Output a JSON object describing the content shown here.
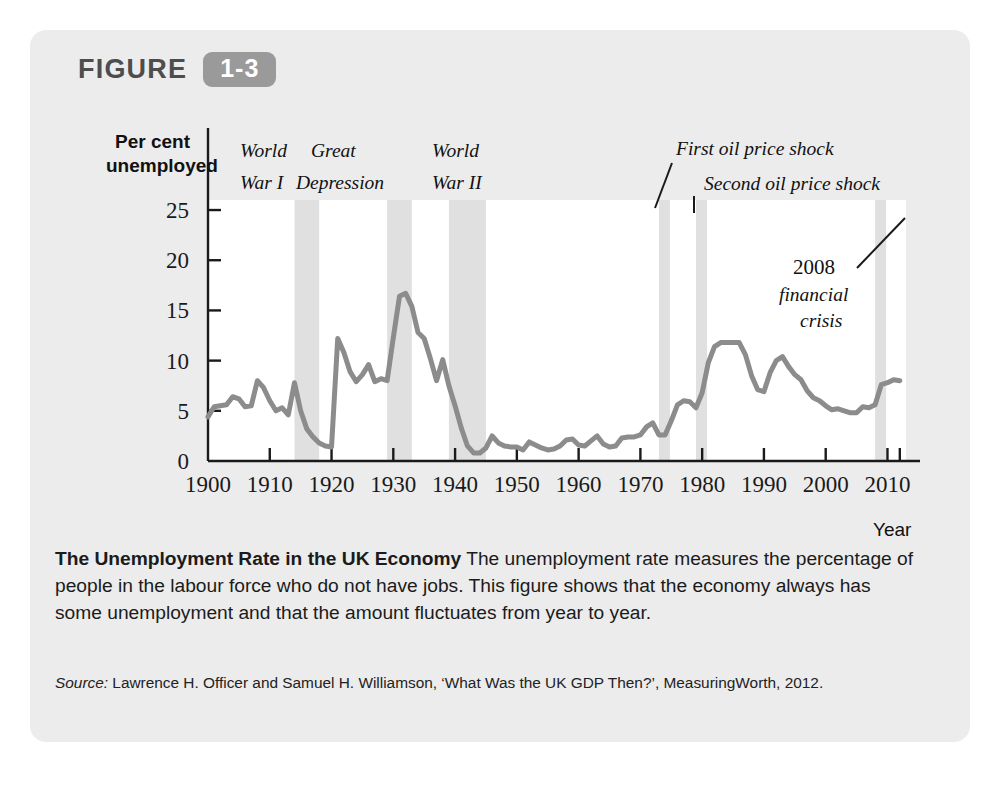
{
  "figure": {
    "label": "FIGURE",
    "number": "1-3",
    "badge_color": "#9a9a9a",
    "panel_color": "#ececec"
  },
  "caption": {
    "title": "The Unemployment Rate in the UK Economy",
    "body": " The unemployment rate measures the percentage of people in the labour force who do not have jobs. This figure shows that the economy always has some unemployment and that the amount fluctuates from year to year."
  },
  "source": {
    "label": "Source:",
    "text": " Lawrence H. Officer and Samuel H. Williamson, ‘What Was the UK GDP Then?’, MeasuringWorth, 2012."
  },
  "chart_data": {
    "type": "line",
    "title": "The Unemployment Rate in the UK Economy",
    "ylabel_line1": "Per cent",
    "ylabel_line2": "unemployed",
    "xlabel": "Year",
    "xlim": [
      1900,
      2013
    ],
    "ylim": [
      0,
      26
    ],
    "yticks": [
      0,
      5,
      10,
      15,
      20,
      25
    ],
    "xticks": [
      1900,
      1910,
      1920,
      1930,
      1940,
      1950,
      1960,
      1970,
      1980,
      1990,
      2000,
      2010
    ],
    "xtick_labels": [
      "1900",
      "1910",
      "1920",
      "1930",
      "1940",
      "1950",
      "1960",
      "1970",
      "1980",
      "1990",
      "2000",
      "2010"
    ],
    "extra_xticks": [
      2012
    ],
    "grid": false,
    "legend": "none",
    "line_color": "#8c8c8c",
    "line_width": 5,
    "series_name": "UK unemployment rate",
    "x": [
      1900,
      1901,
      1902,
      1903,
      1904,
      1905,
      1906,
      1907,
      1908,
      1909,
      1910,
      1911,
      1912,
      1913,
      1914,
      1915,
      1916,
      1917,
      1918,
      1919,
      1920,
      1921,
      1922,
      1923,
      1924,
      1925,
      1926,
      1927,
      1928,
      1929,
      1930,
      1931,
      1932,
      1933,
      1934,
      1935,
      1936,
      1937,
      1938,
      1939,
      1940,
      1941,
      1942,
      1943,
      1944,
      1945,
      1946,
      1947,
      1948,
      1949,
      1950,
      1951,
      1952,
      1953,
      1954,
      1955,
      1956,
      1957,
      1958,
      1959,
      1960,
      1961,
      1962,
      1963,
      1964,
      1965,
      1966,
      1967,
      1968,
      1969,
      1970,
      1971,
      1972,
      1973,
      1974,
      1975,
      1976,
      1977,
      1978,
      1979,
      1980,
      1981,
      1982,
      1983,
      1984,
      1985,
      1986,
      1987,
      1988,
      1989,
      1990,
      1991,
      1992,
      1993,
      1994,
      1995,
      1996,
      1997,
      1998,
      1999,
      2000,
      2001,
      2002,
      2003,
      2004,
      2005,
      2006,
      2007,
      2008,
      2009,
      2010,
      2011,
      2012
    ],
    "y": [
      4.4,
      5.4,
      5.5,
      5.6,
      6.4,
      6.2,
      5.4,
      5.5,
      8.0,
      7.3,
      6.0,
      5.0,
      5.3,
      4.6,
      7.8,
      5.0,
      3.2,
      2.4,
      1.8,
      1.5,
      1.4,
      12.2,
      10.8,
      8.9,
      7.9,
      8.6,
      9.6,
      7.9,
      8.2,
      8.0,
      12.3,
      16.4,
      16.7,
      15.4,
      12.8,
      12.2,
      10.2,
      8.0,
      10.1,
      7.5,
      5.5,
      3.3,
      1.5,
      0.8,
      0.8,
      1.3,
      2.5,
      1.8,
      1.5,
      1.4,
      1.4,
      1.1,
      1.9,
      1.6,
      1.3,
      1.1,
      1.2,
      1.5,
      2.1,
      2.2,
      1.6,
      1.5,
      2.0,
      2.5,
      1.7,
      1.4,
      1.5,
      2.3,
      2.4,
      2.4,
      2.6,
      3.4,
      3.8,
      2.6,
      2.6,
      4.0,
      5.6,
      6.0,
      5.9,
      5.3,
      6.8,
      9.8,
      11.4,
      11.8,
      11.8,
      11.8,
      11.8,
      10.6,
      8.5,
      7.1,
      6.9,
      8.8,
      10.0,
      10.4,
      9.4,
      8.6,
      8.1,
      7.0,
      6.3,
      6.0,
      5.5,
      5.1,
      5.2,
      5.0,
      4.8,
      4.8,
      5.4,
      5.3,
      5.6,
      7.6,
      7.8,
      8.1,
      8.0
    ]
  },
  "annotations": [
    {
      "name": "world-war-1",
      "line1": "World",
      "line2": "War I",
      "x_pct_line1": 158,
      "text_x": 240,
      "text_y": 150
    },
    {
      "name": "great-depression",
      "line1": "Great",
      "line2": "Depression",
      "text_x": 311,
      "text_y": 150
    },
    {
      "name": "world-war-2",
      "line1": "World",
      "line2": "War II",
      "text_x": 432,
      "text_y": 150
    },
    {
      "name": "first-oil-price-shock",
      "line1": "First oil price shock",
      "text_x": 676,
      "text_y": 150
    },
    {
      "name": "second-oil-price-shock",
      "line1": "Second oil price shock",
      "text_x": 704,
      "text_y": 187
    },
    {
      "name": "financial-crisis-2008",
      "line1": "2008",
      "line2": "financial",
      "line3": "crisis",
      "text_x": 793,
      "text_y": 270
    }
  ],
  "shaded_bands": [
    {
      "name": "world-war-1-band",
      "start": 1914,
      "end": 1918,
      "color": "#e0e0e0"
    },
    {
      "name": "great-depression-band",
      "start": 1929,
      "end": 1933,
      "color": "#e0e0e0"
    },
    {
      "name": "world-war-2-band",
      "start": 1939,
      "end": 1945,
      "color": "#e0e0e0"
    },
    {
      "name": "first-oil-shock-band",
      "start": 1973,
      "end": 1974,
      "color": "#e0e0e0"
    },
    {
      "name": "second-oil-shock-band",
      "start": 1979,
      "end": 1980,
      "color": "#e0e0e0"
    },
    {
      "name": "financial-crisis-band",
      "start": 2008,
      "end": 2009,
      "color": "#e0e0e0"
    }
  ]
}
